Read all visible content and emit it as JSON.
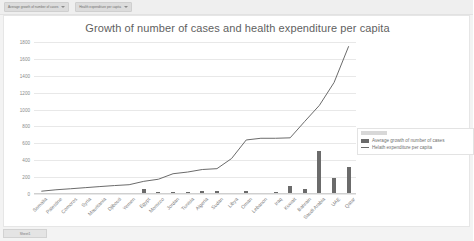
{
  "toolbar": {
    "series_selectors": [
      {
        "label": "Average growth of number of cases"
      },
      {
        "label": "Health expenditure per capita"
      }
    ]
  },
  "sheet_tab": {
    "label": "Sheet1"
  },
  "legend": {
    "entries": [
      {
        "label": "Average growth of number of cases",
        "marker": "bar"
      },
      {
        "label": "Helath expenditure per capita",
        "marker": "line"
      }
    ]
  },
  "colors": {
    "bar": "#6b6b6b",
    "line": "#6b6b6b",
    "grid": "#e8e8e8",
    "text": "#7b7b7b",
    "background": "#ffffff",
    "app_background": "#f3f3f3"
  },
  "chart_data": {
    "type": "bar",
    "title": "Growth of number of cases and health expenditure per capita",
    "xlabel": "",
    "ylabel": "",
    "ylim": [
      0,
      1800
    ],
    "yticks": [
      0,
      200,
      400,
      600,
      800,
      1000,
      1200,
      1400,
      1600,
      1800
    ],
    "ytick_labels": [
      "0",
      "200",
      "400",
      "600",
      "800",
      "1000",
      "1200",
      "1400",
      "1600",
      "1800"
    ],
    "grid": true,
    "legend_position": "right",
    "categories": [
      "Somalia",
      "Palestine",
      "Comoros",
      "Syria",
      "Mauritania",
      "Djibouti",
      "Yemen",
      "Egypt",
      "Morocco",
      "Jordan",
      "Tunisia",
      "Algeria",
      "Sudan",
      "Libya",
      "Oman",
      "Lebanon",
      "Iraq",
      "Kuwait",
      "Bahrain",
      "Saudi Arabia",
      "UAE",
      "Qatar"
    ],
    "series": [
      {
        "name": "Average growth of number of cases",
        "marker": "bar",
        "values": [
          8,
          6,
          5,
          7,
          6,
          10,
          14,
          62,
          22,
          20,
          18,
          34,
          36,
          14,
          30,
          12,
          28,
          95,
          55,
          510,
          195,
          320
        ]
      },
      {
        "name": "Helath expenditure per capita",
        "marker": "line",
        "values": [
          33,
          50,
          62,
          75,
          88,
          100,
          110,
          150,
          175,
          240,
          260,
          290,
          300,
          420,
          640,
          660,
          660,
          665,
          860,
          1050,
          1320,
          1750
        ]
      }
    ]
  }
}
